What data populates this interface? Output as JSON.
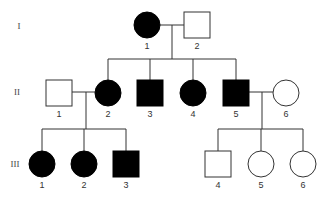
{
  "diagram": {
    "type": "pedigree",
    "colors": {
      "affected": "#000000",
      "unaffected": "#ffffff",
      "line": "#333333"
    },
    "generations": [
      {
        "label": "I",
        "y": 26
      },
      {
        "label": "II",
        "y": 92
      },
      {
        "label": "III",
        "y": 164
      }
    ],
    "individuals": [
      {
        "id": "I-1",
        "label": "1",
        "sex": "female",
        "affected": true,
        "x": 147,
        "y": 25
      },
      {
        "id": "I-2",
        "label": "2",
        "sex": "male",
        "affected": false,
        "x": 197,
        "y": 25
      },
      {
        "id": "II-1",
        "label": "1",
        "sex": "male",
        "affected": false,
        "x": 59,
        "y": 93
      },
      {
        "id": "II-2",
        "label": "2",
        "sex": "female",
        "affected": true,
        "x": 108,
        "y": 93
      },
      {
        "id": "II-3",
        "label": "3",
        "sex": "male",
        "affected": true,
        "x": 150,
        "y": 93
      },
      {
        "id": "II-4",
        "label": "4",
        "sex": "female",
        "affected": true,
        "x": 193,
        "y": 93
      },
      {
        "id": "II-5",
        "label": "5",
        "sex": "male",
        "affected": true,
        "x": 236,
        "y": 93
      },
      {
        "id": "II-6",
        "label": "6",
        "sex": "female",
        "affected": false,
        "x": 286,
        "y": 93
      },
      {
        "id": "III-1",
        "label": "1",
        "sex": "female",
        "affected": true,
        "x": 42,
        "y": 164
      },
      {
        "id": "III-2",
        "label": "2",
        "sex": "female",
        "affected": true,
        "x": 84,
        "y": 164
      },
      {
        "id": "III-3",
        "label": "3",
        "sex": "male",
        "affected": true,
        "x": 126,
        "y": 164
      },
      {
        "id": "III-4",
        "label": "4",
        "sex": "male",
        "affected": false,
        "x": 218,
        "y": 164
      },
      {
        "id": "III-5",
        "label": "5",
        "sex": "female",
        "affected": false,
        "x": 261,
        "y": 164
      },
      {
        "id": "III-6",
        "label": "6",
        "sex": "female",
        "affected": false,
        "x": 303,
        "y": 164
      }
    ],
    "matings": [
      {
        "partners": [
          "I-1",
          "I-2"
        ],
        "children": [
          "II-2",
          "II-3",
          "II-4",
          "II-5"
        ]
      },
      {
        "partners": [
          "II-1",
          "II-2"
        ],
        "children": [
          "III-1",
          "III-2",
          "III-3"
        ]
      },
      {
        "partners": [
          "II-5",
          "II-6"
        ],
        "children": [
          "III-4",
          "III-5",
          "III-6"
        ]
      }
    ]
  }
}
